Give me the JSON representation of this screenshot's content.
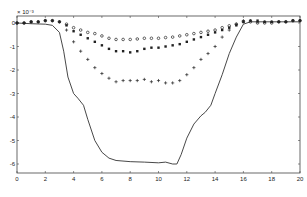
{
  "chart_data": {
    "type": "line",
    "title": "",
    "xlabel": "",
    "ylabel": "",
    "y_scale_annotation": "x 10^-3",
    "xlim": [
      0,
      20
    ],
    "ylim": [
      -6.3,
      0.3
    ],
    "grid": false,
    "legend": null,
    "x_ticks": [
      0,
      2,
      4,
      6,
      8,
      10,
      12,
      14,
      16,
      18,
      20
    ],
    "y_ticks": [
      0,
      -1,
      -2,
      -3,
      -4,
      -5,
      -6
    ],
    "x_tick_labels": [
      "0",
      "2",
      "4",
      "6",
      "8",
      "10",
      "12",
      "14",
      "16",
      "18",
      "20"
    ],
    "y_tick_labels": [
      "0",
      "-1",
      "-2",
      "-3",
      "-4",
      "-5",
      "-6"
    ],
    "series": [
      {
        "name": "solid-line",
        "style": "line",
        "x": [
          0,
          1,
          2,
          2.5,
          3,
          3.3,
          3.6,
          4.0,
          4.3,
          4.7,
          5.0,
          5.5,
          6.0,
          6.5,
          7.0,
          8.0,
          9.0,
          10.0,
          10.5,
          11.0,
          11.3,
          11.6,
          12.0,
          12.5,
          13.0,
          13.3,
          13.7,
          14.0,
          14.5,
          15.0,
          15.5,
          16.0,
          16.5,
          17,
          18,
          19,
          20
        ],
        "values": [
          0,
          -0.03,
          -0.05,
          -0.1,
          -0.4,
          -1.2,
          -2.3,
          -3.0,
          -3.2,
          -3.5,
          -4.1,
          -5.0,
          -5.5,
          -5.75,
          -5.85,
          -5.9,
          -5.92,
          -5.95,
          -5.92,
          -6.0,
          -6.0,
          -5.6,
          -4.9,
          -4.3,
          -3.95,
          -3.8,
          -3.5,
          -3.0,
          -2.2,
          -1.3,
          -0.6,
          -0.05,
          0.05,
          0.05,
          0.05,
          0.05,
          0.05
        ]
      },
      {
        "name": "plus-markers",
        "style": "marker-plus",
        "x": [
          0,
          0.5,
          1,
          1.5,
          2,
          2.5,
          3,
          3.5,
          4,
          4.5,
          5,
          5.5,
          6,
          6.5,
          7,
          7.5,
          8,
          8.5,
          9,
          9.5,
          10,
          10.5,
          11,
          11.5,
          12,
          12.5,
          13,
          13.5,
          14,
          14.5,
          15,
          15.5,
          16,
          16.5,
          17,
          17.5,
          18,
          18.5,
          19,
          19.5,
          20
        ],
        "values": [
          0,
          0,
          0.05,
          0.05,
          0.1,
          0.1,
          0.05,
          -0.3,
          -0.8,
          -1.2,
          -1.55,
          -1.9,
          -2.15,
          -2.35,
          -2.5,
          -2.45,
          -2.45,
          -2.45,
          -2.4,
          -2.5,
          -2.45,
          -2.55,
          -2.55,
          -2.45,
          -2.2,
          -1.9,
          -1.55,
          -1.3,
          -1.0,
          -0.6,
          -0.3,
          -0.05,
          0.1,
          0.1,
          0.05,
          0.05,
          0.05,
          0.05,
          0.05,
          0.1,
          0.1
        ]
      },
      {
        "name": "filled-square-markers",
        "style": "marker-square",
        "x": [
          0,
          0.5,
          1,
          1.5,
          2,
          2.5,
          3,
          3.5,
          4,
          4.5,
          5,
          5.5,
          6,
          6.5,
          7,
          7.5,
          8,
          8.5,
          9,
          9.5,
          10,
          10.5,
          11,
          11.5,
          12,
          12.5,
          13,
          13.5,
          14,
          14.5,
          15,
          15.5,
          16,
          16.5,
          17,
          17.5,
          18,
          18.5,
          19,
          19.5,
          20
        ],
        "values": [
          0,
          0,
          0.05,
          0.05,
          0.1,
          0.1,
          0.05,
          -0.1,
          -0.35,
          -0.5,
          -0.65,
          -0.8,
          -0.95,
          -1.1,
          -1.2,
          -1.2,
          -1.25,
          -1.2,
          -1.1,
          -1.05,
          -1.05,
          -1.0,
          -0.95,
          -0.9,
          -0.8,
          -0.7,
          -0.6,
          -0.5,
          -0.4,
          -0.3,
          -0.2,
          -0.1,
          0.05,
          0.1,
          0.1,
          0.05,
          0.05,
          0.05,
          0.05,
          0.1,
          0.1
        ]
      },
      {
        "name": "open-circle-markers",
        "style": "marker-circle",
        "x": [
          0,
          0.5,
          1,
          1.5,
          2,
          2.5,
          3,
          3.5,
          4,
          4.5,
          5,
          5.5,
          6,
          6.5,
          7,
          7.5,
          8,
          8.5,
          9,
          9.5,
          10,
          10.5,
          11,
          11.5,
          12,
          12.5,
          13,
          13.5,
          14,
          14.5,
          15,
          15.5,
          16,
          16.5,
          17,
          17.5,
          18,
          18.5,
          19,
          19.5,
          20
        ],
        "values": [
          0,
          0,
          0.05,
          0.05,
          0.1,
          0.1,
          0.05,
          -0.05,
          -0.2,
          -0.3,
          -0.4,
          -0.45,
          -0.55,
          -0.65,
          -0.7,
          -0.7,
          -0.7,
          -0.68,
          -0.65,
          -0.65,
          -0.65,
          -0.62,
          -0.6,
          -0.55,
          -0.5,
          -0.45,
          -0.4,
          -0.35,
          -0.3,
          -0.2,
          -0.12,
          -0.05,
          0.05,
          0.05,
          0.0,
          0.0,
          0.0,
          0.05,
          0.05,
          0.1,
          0.1
        ]
      }
    ]
  },
  "plot_frame": {
    "left": 17,
    "right": 300,
    "top": 16,
    "bottom": 173,
    "y_zero_px": 23,
    "px_per_unit_y": 23.5,
    "px_per_unit_x": 14.15,
    "line_color": "#333333",
    "marker_color": "#222222"
  }
}
